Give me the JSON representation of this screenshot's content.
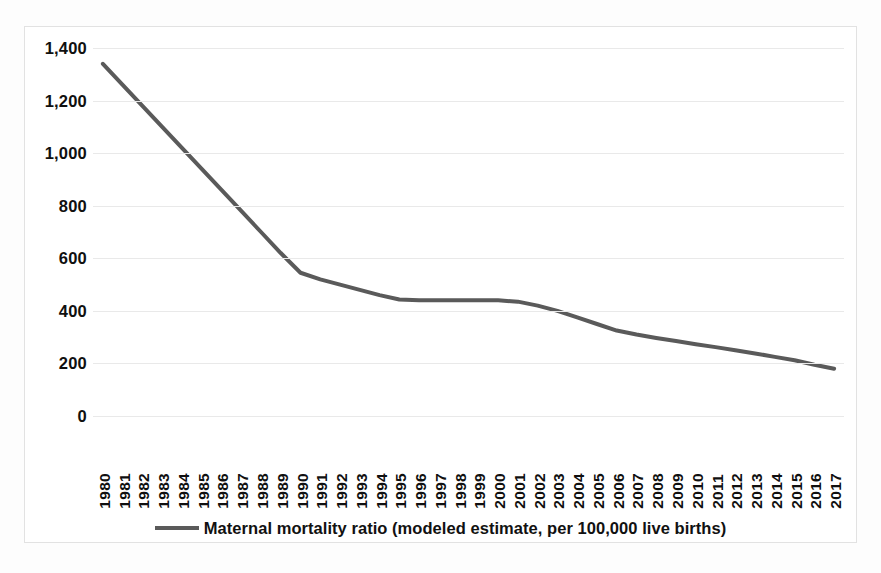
{
  "chart_data": {
    "type": "line",
    "title": "",
    "xlabel": "",
    "ylabel": "",
    "ylim": [
      0,
      1400
    ],
    "y_ticks": [
      "0",
      "200",
      "400",
      "600",
      "800",
      "1,000",
      "1,200",
      "1,400"
    ],
    "y_tick_values": [
      0,
      200,
      400,
      600,
      800,
      1000,
      1200,
      1400
    ],
    "grid": true,
    "legend_position": "bottom",
    "legend": [
      "Maternal mortality ratio (modeled estimate, per 100,000 live births)"
    ],
    "line_color": "#5a5a5a",
    "gridline_color": "#e9e9e9",
    "categories": [
      "1980",
      "1981",
      "1982",
      "1983",
      "1984",
      "1985",
      "1986",
      "1987",
      "1988",
      "1989",
      "1990",
      "1991",
      "1992",
      "1993",
      "1994",
      "1995",
      "1996",
      "1997",
      "1998",
      "1999",
      "2000",
      "2001",
      "2002",
      "2003",
      "2004",
      "2005",
      "2006",
      "2007",
      "2008",
      "2009",
      "2010",
      "2011",
      "2012",
      "2013",
      "2014",
      "2015",
      "2016",
      "2017"
    ],
    "series": [
      {
        "name": "Maternal mortality ratio (modeled estimate, per 100,000 live births)",
        "values": [
          1340,
          1260,
          1180,
          1100,
          1020,
          940,
          860,
          780,
          700,
          620,
          545,
          520,
          500,
          480,
          460,
          443,
          440,
          440,
          440,
          440,
          440,
          435,
          420,
          400,
          375,
          350,
          325,
          310,
          297,
          285,
          273,
          262,
          250,
          238,
          225,
          212,
          195,
          180
        ]
      }
    ]
  },
  "legend": {
    "swatch_name": "series-line-swatch",
    "label": "Maternal mortality ratio (modeled estimate, per 100,000 live births)"
  }
}
